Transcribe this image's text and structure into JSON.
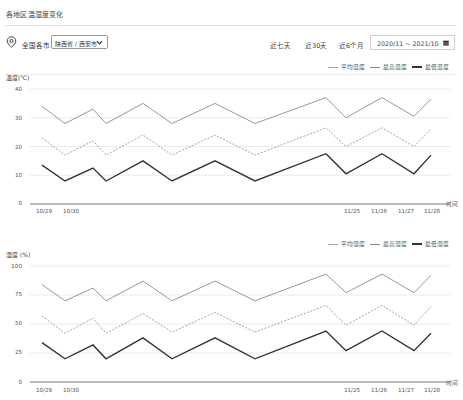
{
  "page": {
    "title": "各地区温湿度变化"
  },
  "filters": {
    "region_label": "全国各市:",
    "region_value": "陕西省 / 西安市",
    "ranges": [
      "近七天",
      "近30天",
      "近6个月"
    ],
    "date_range": "2020/11 ~ 2021/10"
  },
  "colors": {
    "avg": "#9a9a9a",
    "max": "#8c8c8c",
    "min": "#333333",
    "grid": "#e4e4e4",
    "axis": "#666666"
  },
  "chart_data": [
    {
      "type": "line",
      "title": "",
      "ylabel": "温度(℃)",
      "xlabel": "时间",
      "ylim": [
        0,
        40
      ],
      "yticks": [
        0,
        10,
        20,
        30,
        40
      ],
      "grid": true,
      "legend_position": "top-right",
      "x_labels": [
        {
          "label": "10/29",
          "pos": 42
        },
        {
          "label": "10/30",
          "pos": 70
        },
        {
          "label": "11/25",
          "pos": 350
        },
        {
          "label": "11/26",
          "pos": 377
        },
        {
          "label": "11/27",
          "pos": 404
        },
        {
          "label": "11/28",
          "pos": 430
        }
      ],
      "x": [
        42,
        65,
        93,
        106,
        143,
        172,
        215,
        255,
        326,
        346,
        382,
        414,
        431
      ],
      "series": [
        {
          "name": "平均温度",
          "style": "dashed",
          "values": [
            23,
            17,
            22,
            17,
            24,
            17,
            24,
            17,
            26.5,
            20,
            26.5,
            20,
            26
          ]
        },
        {
          "name": "最高温度",
          "style": "solid-thin",
          "values": [
            34,
            28,
            33,
            28,
            35,
            28,
            35,
            28,
            37,
            30,
            37,
            30.5,
            36.5
          ]
        },
        {
          "name": "最低温度",
          "style": "solid-thick",
          "values": [
            13.5,
            8,
            12.5,
            8,
            15,
            8,
            15,
            8,
            17.5,
            10.5,
            17.5,
            10.5,
            17
          ]
        }
      ]
    },
    {
      "type": "line",
      "title": "",
      "ylabel": "湿度 (%)",
      "xlabel": "时间",
      "ylim": [
        0,
        100
      ],
      "yticks": [
        0,
        25,
        50,
        75,
        100
      ],
      "grid": true,
      "legend_position": "top-right",
      "x_labels": [
        {
          "label": "10/29",
          "pos": 42
        },
        {
          "label": "10/30",
          "pos": 70
        },
        {
          "label": "11/25",
          "pos": 350
        },
        {
          "label": "11/26",
          "pos": 377
        },
        {
          "label": "11/27",
          "pos": 404
        },
        {
          "label": "11/28",
          "pos": 430
        }
      ],
      "x": [
        42,
        65,
        93,
        106,
        143,
        172,
        215,
        255,
        326,
        346,
        382,
        414,
        431
      ],
      "series": [
        {
          "name": "平均湿度",
          "style": "dashed",
          "values": [
            57,
            42,
            55,
            42,
            59,
            43,
            60,
            43,
            66,
            49,
            66,
            49,
            65
          ]
        },
        {
          "name": "最高湿度",
          "style": "solid-thin",
          "values": [
            84,
            70,
            81,
            70,
            87,
            70,
            87,
            70,
            93,
            77,
            93,
            77,
            92
          ]
        },
        {
          "name": "最低湿度",
          "style": "solid-thick",
          "values": [
            34,
            20,
            32,
            20,
            38,
            20,
            38,
            20,
            44,
            27,
            44,
            27,
            42
          ]
        }
      ]
    }
  ]
}
